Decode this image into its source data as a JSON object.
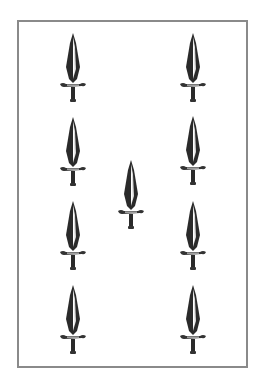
{
  "card": {
    "name": "Nine of Swords",
    "suit": "swords",
    "rank": 9,
    "border_color": "#8a8a8a",
    "background": "#ffffff",
    "pips": [
      {
        "x": 73,
        "y": 33
      },
      {
        "x": 193,
        "y": 33
      },
      {
        "x": 73,
        "y": 117
      },
      {
        "x": 193,
        "y": 116
      },
      {
        "x": 131,
        "y": 160
      },
      {
        "x": 73,
        "y": 201
      },
      {
        "x": 193,
        "y": 201
      },
      {
        "x": 73,
        "y": 285
      },
      {
        "x": 193,
        "y": 285
      }
    ],
    "pip_icon": "sword-icon"
  }
}
